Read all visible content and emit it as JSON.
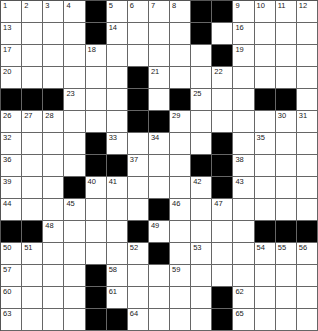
{
  "puzzle": {
    "rows": 15,
    "cols": 15,
    "colors": {
      "block": "#000000",
      "cell": "#ffffff",
      "line": "#666666"
    },
    "grid": [
      "....#....##....",
      "....#....#.....",
      "..........#....",
      "......#........",
      "###...#.#...##.",
      "......##.......",
      "....#.....#....",
      "....##...##....",
      "...#......#....",
      ".......#.......",
      "##....#.....###",
      ".......#.......",
      "....#..........",
      "....#.....#....",
      "....##....#...."
    ],
    "numbers": [
      {
        "r": 0,
        "c": 0,
        "n": "1"
      },
      {
        "r": 0,
        "c": 1,
        "n": "2"
      },
      {
        "r": 0,
        "c": 2,
        "n": "3"
      },
      {
        "r": 0,
        "c": 3,
        "n": "4"
      },
      {
        "r": 0,
        "c": 5,
        "n": "5"
      },
      {
        "r": 0,
        "c": 6,
        "n": "6"
      },
      {
        "r": 0,
        "c": 7,
        "n": "7"
      },
      {
        "r": 0,
        "c": 8,
        "n": "8"
      },
      {
        "r": 0,
        "c": 11,
        "n": "9"
      },
      {
        "r": 0,
        "c": 12,
        "n": "10"
      },
      {
        "r": 0,
        "c": 13,
        "n": "11"
      },
      {
        "r": 0,
        "c": 14,
        "n": "12"
      },
      {
        "r": 1,
        "c": 0,
        "n": "13"
      },
      {
        "r": 1,
        "c": 5,
        "n": "14"
      },
      {
        "r": 1,
        "c": 9,
        "n": "15"
      },
      {
        "r": 1,
        "c": 11,
        "n": "16"
      },
      {
        "r": 2,
        "c": 0,
        "n": "17"
      },
      {
        "r": 2,
        "c": 4,
        "n": "18"
      },
      {
        "r": 2,
        "c": 11,
        "n": "19"
      },
      {
        "r": 3,
        "c": 0,
        "n": "20"
      },
      {
        "r": 3,
        "c": 7,
        "n": "21"
      },
      {
        "r": 3,
        "c": 10,
        "n": "22"
      },
      {
        "r": 4,
        "c": 3,
        "n": "23"
      },
      {
        "r": 4,
        "c": 6,
        "n": "24"
      },
      {
        "r": 4,
        "c": 9,
        "n": "25"
      },
      {
        "r": 5,
        "c": 0,
        "n": "26"
      },
      {
        "r": 5,
        "c": 1,
        "n": "27"
      },
      {
        "r": 5,
        "c": 2,
        "n": "28"
      },
      {
        "r": 5,
        "c": 8,
        "n": "29"
      },
      {
        "r": 5,
        "c": 13,
        "n": "30"
      },
      {
        "r": 5,
        "c": 14,
        "n": "31"
      },
      {
        "r": 6,
        "c": 0,
        "n": "32"
      },
      {
        "r": 6,
        "c": 5,
        "n": "33"
      },
      {
        "r": 6,
        "c": 7,
        "n": "34"
      },
      {
        "r": 6,
        "c": 12,
        "n": "35"
      },
      {
        "r": 7,
        "c": 0,
        "n": "36"
      },
      {
        "r": 7,
        "c": 6,
        "n": "37"
      },
      {
        "r": 7,
        "c": 11,
        "n": "38"
      },
      {
        "r": 8,
        "c": 0,
        "n": "39"
      },
      {
        "r": 8,
        "c": 4,
        "n": "40"
      },
      {
        "r": 8,
        "c": 5,
        "n": "41"
      },
      {
        "r": 8,
        "c": 9,
        "n": "42"
      },
      {
        "r": 8,
        "c": 11,
        "n": "43"
      },
      {
        "r": 9,
        "c": 0,
        "n": "44"
      },
      {
        "r": 9,
        "c": 3,
        "n": "45"
      },
      {
        "r": 9,
        "c": 8,
        "n": "46"
      },
      {
        "r": 9,
        "c": 10,
        "n": "47"
      },
      {
        "r": 10,
        "c": 2,
        "n": "48"
      },
      {
        "r": 10,
        "c": 7,
        "n": "49"
      },
      {
        "r": 11,
        "c": 0,
        "n": "50"
      },
      {
        "r": 11,
        "c": 1,
        "n": "51"
      },
      {
        "r": 11,
        "c": 6,
        "n": "52"
      },
      {
        "r": 11,
        "c": 9,
        "n": "53"
      },
      {
        "r": 11,
        "c": 12,
        "n": "54"
      },
      {
        "r": 11,
        "c": 13,
        "n": "55"
      },
      {
        "r": 11,
        "c": 14,
        "n": "56"
      },
      {
        "r": 12,
        "c": 0,
        "n": "57"
      },
      {
        "r": 12,
        "c": 5,
        "n": "58"
      },
      {
        "r": 12,
        "c": 8,
        "n": "59"
      },
      {
        "r": 13,
        "c": 0,
        "n": "60"
      },
      {
        "r": 13,
        "c": 5,
        "n": "61"
      },
      {
        "r": 13,
        "c": 11,
        "n": "62"
      },
      {
        "r": 14,
        "c": 0,
        "n": "63"
      },
      {
        "r": 14,
        "c": 6,
        "n": "64"
      },
      {
        "r": 14,
        "c": 11,
        "n": "65"
      }
    ]
  }
}
